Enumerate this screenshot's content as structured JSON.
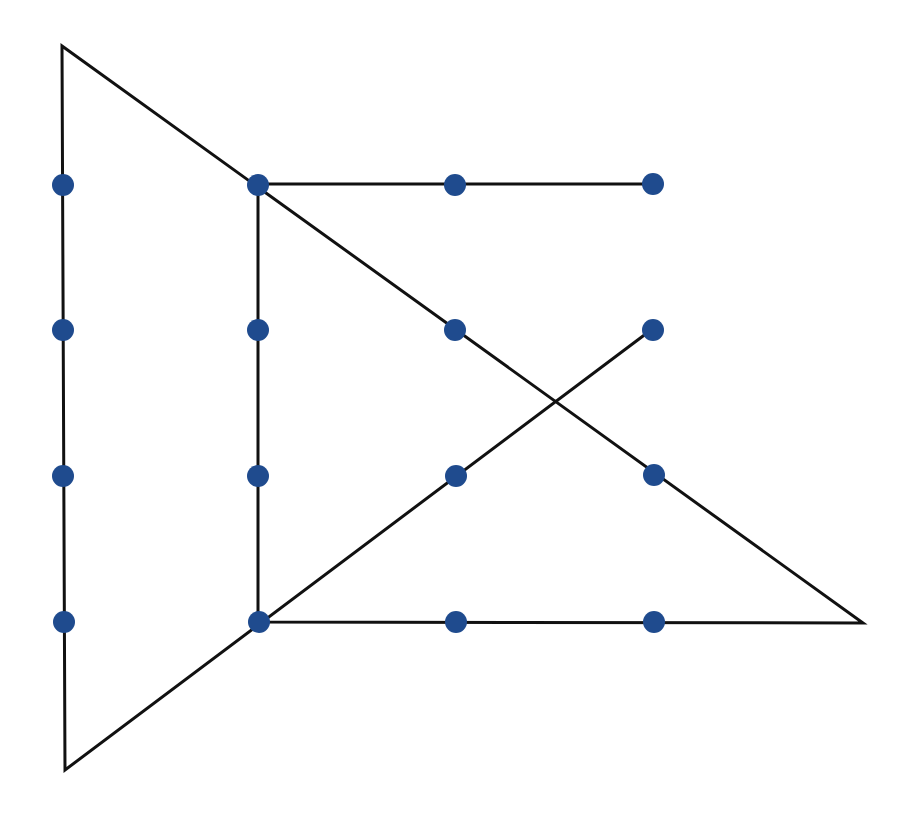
{
  "diagram": {
    "type": "dot-grid-puzzle",
    "dot_color": "#1f4b8e",
    "line_color": "#111111",
    "dot_radius": 11,
    "line_width": 3,
    "dots": [
      {
        "x": 63,
        "y": 185
      },
      {
        "x": 258,
        "y": 185
      },
      {
        "x": 455,
        "y": 185
      },
      {
        "x": 653,
        "y": 184
      },
      {
        "x": 63,
        "y": 330
      },
      {
        "x": 258,
        "y": 330
      },
      {
        "x": 455,
        "y": 330
      },
      {
        "x": 653,
        "y": 330
      },
      {
        "x": 63,
        "y": 476
      },
      {
        "x": 258,
        "y": 476
      },
      {
        "x": 456,
        "y": 476
      },
      {
        "x": 654,
        "y": 475
      },
      {
        "x": 64,
        "y": 622
      },
      {
        "x": 259,
        "y": 622
      },
      {
        "x": 456,
        "y": 622
      },
      {
        "x": 654,
        "y": 622
      }
    ],
    "path": [
      {
        "x": 651,
        "y": 184
      },
      {
        "x": 258,
        "y": 184
      },
      {
        "x": 258,
        "y": 622
      },
      {
        "x": 863,
        "y": 623
      },
      {
        "x": 62,
        "y": 46
      },
      {
        "x": 65,
        "y": 770
      },
      {
        "x": 651,
        "y": 330
      }
    ]
  }
}
